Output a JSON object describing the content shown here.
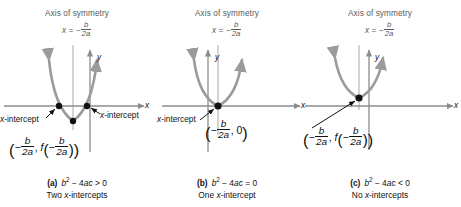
{
  "figure": {
    "panels": [
      {
        "id": "a",
        "axis_of_symmetry_title": "Axis of symmetry",
        "axis_of_symmetry_eq_lhs": "x = −",
        "axis_of_symmetry_num": "b",
        "axis_of_symmetry_den": "2a",
        "x_axis_label": "x",
        "y_axis_label": "y",
        "intercept_label_left": "x-intercept",
        "intercept_label_right": "x-intercept",
        "vertex_label": "( − b/2a , f( − b/2a ) )",
        "caption_letter": "(a)",
        "caption_condition": "b² − 4ac > 0",
        "caption_result": "Two x-intercepts"
      },
      {
        "id": "b",
        "axis_of_symmetry_title": "Axis of symmetry",
        "axis_of_symmetry_eq_lhs": "x = −",
        "axis_of_symmetry_num": "b",
        "axis_of_symmetry_den": "2a",
        "x_axis_label": "x",
        "y_axis_label": "y",
        "intercept_label_left": "x-intercept",
        "vertex_label": "( − b/2a , 0 )",
        "caption_letter": "(b)",
        "caption_condition": "b² − 4ac = 0",
        "caption_result": "One x-intercept"
      },
      {
        "id": "c",
        "axis_of_symmetry_title": "Axis of symmetry",
        "axis_of_symmetry_eq_lhs": "x = −",
        "axis_of_symmetry_num": "b",
        "axis_of_symmetry_den": "2a",
        "x_axis_label": "x",
        "y_axis_label": "y",
        "vertex_label": "( − b/2a , f( − b/2a ) )",
        "caption_letter": "(c)",
        "caption_condition": "b² − 4ac < 0",
        "caption_result": "No x-intercepts"
      }
    ],
    "symbols": {
      "minus": "−",
      "b": "b",
      "two_a": "2a",
      "zero": "0",
      "f": "f",
      "x_eq": "x =",
      "comma": ",",
      "lparen": "(",
      "rparen": ")",
      "b_squared": "b",
      "sup2": "2",
      "minus_4ac_gt": "− 4ac > 0",
      "minus_4ac_eq": "− 4ac = 0",
      "minus_4ac_lt": "− 4ac < 0"
    },
    "colors": {
      "curve": "#9b9b9b",
      "axis": "#8c8c8c",
      "symmetry_line": "#c9c9c9",
      "point": "#111111",
      "text": "#111111",
      "muted_text": "#5a5a5a",
      "background": "#ffffff"
    }
  }
}
